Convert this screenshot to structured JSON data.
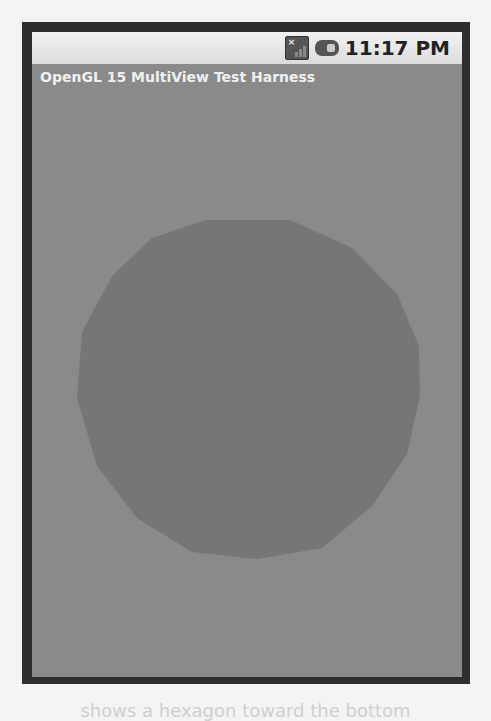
{
  "status_bar": {
    "time": "11:17 PM",
    "icons": [
      "signal-no-sim-icon",
      "battery-icon"
    ]
  },
  "app": {
    "title": "OpenGL 15 MultiView Test Harness"
  },
  "gl_view": {
    "background_color": "#8a8a8a",
    "shape": "polygon-circle",
    "shape_color": "#767676"
  },
  "page_caption_fragment": "shows a hexagon toward the bottom"
}
